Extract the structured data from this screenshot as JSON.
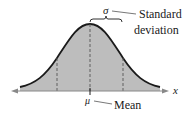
{
  "diagram": {
    "labels": {
      "sigma": "σ",
      "std_line1": "Standard",
      "std_line2": "deviation",
      "mu": "μ",
      "mean": "Mean",
      "x_axis": "x"
    },
    "colors": {
      "fill": "#bdbdbd",
      "curve": "#1a1a1a",
      "dashed": "#555555",
      "axis": "#888888",
      "text": "#1a1a1a"
    },
    "dashed_markers": [
      "μ-σ",
      "μ",
      "μ+σ"
    ]
  }
}
